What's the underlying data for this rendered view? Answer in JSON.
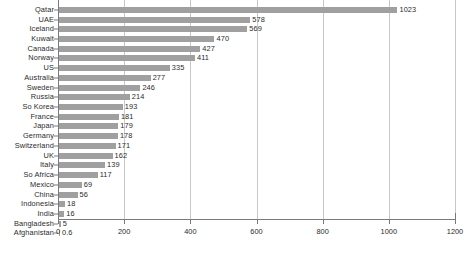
{
  "chart_data": {
    "type": "bar",
    "orientation": "horizontal",
    "title": "",
    "subtitle": "",
    "xlabel": "",
    "ylabel": "",
    "xlim": [
      0,
      1200
    ],
    "xticks": [
      0,
      200,
      400,
      600,
      800,
      1000,
      1200
    ],
    "xtick_labels": [
      "0",
      "200",
      "400",
      "600",
      "800",
      "1000",
      "1200"
    ],
    "grid": "vertical",
    "legend": "none",
    "bar_color": "#a0a0a0",
    "axis_color": "#7a7a7a",
    "grid_color": "#c8c8c8",
    "text_color": "#2b2b2b",
    "background": "#ffffff",
    "categories": [
      "Qatar",
      "UAE",
      "Iceland",
      "Kuwait",
      "Canada",
      "Norway",
      "US",
      "Australia",
      "Sweden",
      "Russia",
      "So Korea",
      "France",
      "Japan",
      "Germany",
      "Switzerland",
      "UK",
      "Italy",
      "So Africa",
      "Mexico",
      "China",
      "Indonesia",
      "India",
      "Bangladesh",
      "Afghanistan"
    ],
    "values": [
      1023,
      578,
      569,
      470,
      427,
      411,
      335,
      277,
      246,
      214,
      193,
      181,
      179,
      178,
      171,
      162,
      139,
      117,
      69,
      56,
      18,
      16,
      5,
      0.6
    ],
    "value_labels": [
      "1023",
      "578",
      "569",
      "470",
      "427",
      "411",
      "335",
      "277",
      "246",
      "214",
      "193",
      "181",
      "179",
      "178",
      "171",
      "162",
      "139",
      "117",
      "69",
      "56",
      "18",
      "16",
      "5",
      "0.6"
    ]
  }
}
